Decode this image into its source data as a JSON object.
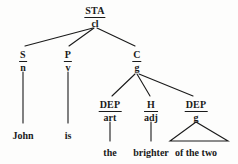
{
  "diagram": {
    "type": "syntax-tree",
    "title": "",
    "nodes": {
      "root": {
        "function": "STA",
        "class": "cl",
        "x": 95,
        "y": 6
      },
      "subject": {
        "function": "S",
        "class": "n",
        "x": 23,
        "y": 50
      },
      "predicator": {
        "function": "P",
        "class": "v",
        "x": 68,
        "y": 50
      },
      "complement": {
        "function": "C",
        "class": "g",
        "x": 137,
        "y": 50
      },
      "dep_art": {
        "function": "DEP",
        "class": "art",
        "x": 110,
        "y": 100
      },
      "head_adj": {
        "function": "H",
        "class": "adj",
        "x": 151,
        "y": 100
      },
      "dep_g": {
        "function": "DEP",
        "class": "g",
        "x": 196,
        "y": 100
      }
    },
    "leaves": {
      "john": {
        "text": "John",
        "x": 23,
        "y": 131
      },
      "is": {
        "text": "is",
        "x": 68,
        "y": 131
      },
      "the": {
        "text": "the",
        "x": 110,
        "y": 148
      },
      "brighter": {
        "text": "brighter",
        "x": 151,
        "y": 148
      },
      "of_the_two": {
        "text": "of the two",
        "x": 196,
        "y": 148
      }
    },
    "colors": {
      "ink": "#1a1a1a",
      "paper": "#fdfdfc"
    }
  }
}
